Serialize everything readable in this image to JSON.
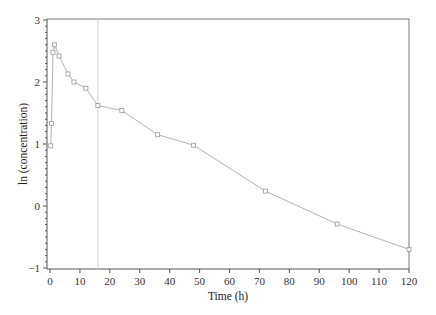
{
  "chart_data": {
    "type": "line",
    "title": "",
    "xlabel": "Time (h)",
    "ylabel": "ln (concentration)",
    "xlim": [
      0,
      120
    ],
    "ylim": [
      -1,
      3
    ],
    "xticks": [
      0,
      10,
      20,
      30,
      40,
      50,
      60,
      70,
      80,
      90,
      100,
      110,
      120
    ],
    "yticks": [
      -1,
      0,
      1,
      2,
      3
    ],
    "grid": false,
    "legend": null,
    "reference_line": {
      "orientation": "vertical",
      "x": 16
    },
    "series": [
      {
        "name": "ln (concentration)",
        "marker": "square",
        "x": [
          0.25,
          0.5,
          1,
          1.5,
          3,
          6,
          8,
          12,
          16,
          24,
          36,
          48,
          72,
          96,
          120
        ],
        "y": [
          0.97,
          1.33,
          2.48,
          2.6,
          2.42,
          2.13,
          2.0,
          1.9,
          1.62,
          1.54,
          1.15,
          0.98,
          0.24,
          -0.29,
          -0.7
        ]
      }
    ],
    "colors": {
      "line": "#b4b4b4",
      "marker": "#9a9a9a",
      "axis": "#555555",
      "reference_line": "#cfcfcf"
    }
  }
}
